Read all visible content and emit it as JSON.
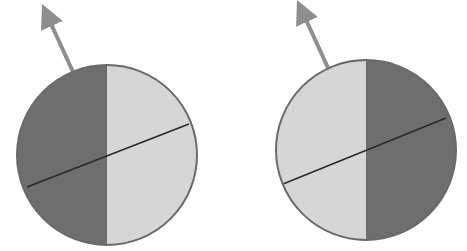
{
  "colors": {
    "background": "#ffffff",
    "dark_half": "#6e6e6e",
    "light_half": "#d6d6d6",
    "outline": "#6a6a6a",
    "axis_line": "#2a2a2a",
    "arrow": "#8e8e8e"
  },
  "diagrams": [
    {
      "name": "left-sphere",
      "center": [
        107,
        155
      ],
      "radius": 90,
      "dark_side": "left",
      "axis_line": [
        [
          27,
          187
        ],
        [
          189,
          124
        ]
      ],
      "arrow": {
        "from": [
          73,
          72
        ],
        "to": [
          45,
          10
        ]
      }
    },
    {
      "name": "right-sphere",
      "center": [
        366,
        150
      ],
      "radius": 90,
      "dark_side": "right",
      "axis_line": [
        [
          283,
          184
        ],
        [
          446,
          118
        ]
      ],
      "arrow": {
        "from": [
          329,
          70
        ],
        "to": [
          300,
          6
        ]
      }
    }
  ]
}
